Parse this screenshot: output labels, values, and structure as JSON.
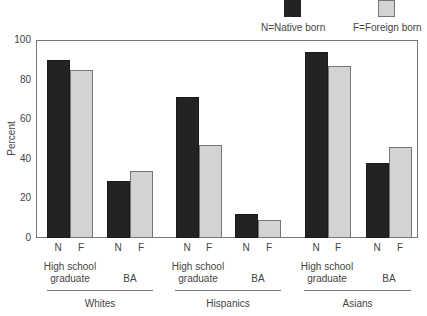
{
  "chart_data": {
    "type": "bar",
    "title": "",
    "xlabel": "",
    "ylabel": "Percent",
    "ylim": [
      0,
      100
    ],
    "yticks": [
      0,
      20,
      40,
      60,
      80,
      100
    ],
    "grid": false,
    "legend_position": "top-right",
    "legend": [
      {
        "key": "N",
        "label": "N=Native born",
        "color": "#232323"
      },
      {
        "key": "F",
        "label": "F=Foreign born",
        "color": "#d3d3d3"
      }
    ],
    "groups": [
      "Whites",
      "Hispanics",
      "Asians"
    ],
    "subcategories": [
      "High school graduate",
      "BA"
    ],
    "categories": [
      "Whites - High school graduate",
      "Whites - BA",
      "Hispanics - High school graduate",
      "Hispanics - BA",
      "Asians - High school graduate",
      "Asians - BA"
    ],
    "series": [
      {
        "name": "N=Native born",
        "values": [
          90,
          29,
          71,
          12,
          94,
          38
        ]
      },
      {
        "name": "F=Foreign born",
        "values": [
          85,
          34,
          47,
          9,
          87,
          46
        ]
      }
    ]
  },
  "legend": {
    "native_label": "N=Native born",
    "foreign_label": "F=Foreign born"
  },
  "axis": {
    "ylabel": "Percent",
    "ticks": [
      "0",
      "20",
      "40",
      "60",
      "80",
      "100"
    ]
  },
  "bar_labels": {
    "native": "N",
    "foreign": "F"
  },
  "subcategories": {
    "hs_line1": "High school",
    "hs_line2": "graduate",
    "ba": "BA"
  },
  "groups": [
    "Whites",
    "Hispanics",
    "Asians"
  ]
}
